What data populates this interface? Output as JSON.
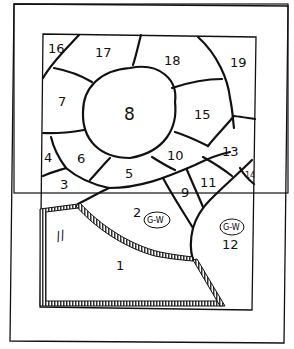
{
  "diagram": {
    "type": "stained-glass-pattern",
    "colors": {
      "line": "#111111",
      "paper": "#ffffff",
      "border_hatch": "#333333"
    },
    "regions": [
      {
        "id": "1",
        "label": "1"
      },
      {
        "id": "2",
        "label": "2",
        "annotation": "G-W"
      },
      {
        "id": "3",
        "label": "3"
      },
      {
        "id": "4",
        "label": "4"
      },
      {
        "id": "5",
        "label": "5"
      },
      {
        "id": "6",
        "label": "6"
      },
      {
        "id": "7",
        "label": "7"
      },
      {
        "id": "8",
        "label": "8"
      },
      {
        "id": "9",
        "label": "9"
      },
      {
        "id": "10",
        "label": "10"
      },
      {
        "id": "11",
        "label": "11"
      },
      {
        "id": "12",
        "label": "12",
        "annotation": "G-W"
      },
      {
        "id": "13",
        "label": "13"
      },
      {
        "id": "14",
        "label": "14"
      },
      {
        "id": "15",
        "label": "15"
      },
      {
        "id": "16",
        "label": "16"
      },
      {
        "id": "17",
        "label": "17"
      },
      {
        "id": "18",
        "label": "18"
      },
      {
        "id": "19",
        "label": "19"
      }
    ],
    "margin_mark": "//"
  }
}
